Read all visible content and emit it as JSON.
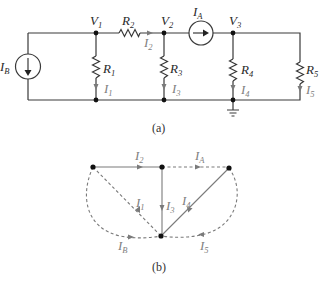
{
  "figure_a": {
    "caption": "(a)",
    "nodes": [
      {
        "id": "V1",
        "label": "V",
        "sub": "1"
      },
      {
        "id": "V2",
        "label": "V",
        "sub": "2"
      },
      {
        "id": "V3",
        "label": "V",
        "sub": "3"
      }
    ],
    "sources": [
      {
        "id": "IB",
        "label": "I",
        "sub": "B",
        "direction": "down"
      },
      {
        "id": "IA",
        "label": "I",
        "sub": "A",
        "direction": "right"
      }
    ],
    "resistors": [
      {
        "id": "R1",
        "label": "R",
        "sub": "1"
      },
      {
        "id": "R2",
        "label": "R",
        "sub": "2"
      },
      {
        "id": "R3",
        "label": "R",
        "sub": "3"
      },
      {
        "id": "R4",
        "label": "R",
        "sub": "4"
      },
      {
        "id": "R5",
        "label": "R",
        "sub": "5"
      }
    ],
    "currents": [
      {
        "id": "I1",
        "label": "I",
        "sub": "1"
      },
      {
        "id": "I2",
        "label": "I",
        "sub": "2"
      },
      {
        "id": "I3",
        "label": "I",
        "sub": "3"
      },
      {
        "id": "I4",
        "label": "I",
        "sub": "4"
      },
      {
        "id": "I5",
        "label": "I",
        "sub": "5"
      }
    ],
    "ground": "ground-symbol"
  },
  "figure_b": {
    "caption": "(b)",
    "edges": [
      {
        "id": "I2",
        "label": "I",
        "sub": "2",
        "style": "solid"
      },
      {
        "id": "IA",
        "label": "I",
        "sub": "A",
        "style": "dashed"
      },
      {
        "id": "I1",
        "label": "I",
        "sub": "1",
        "style": "dashed"
      },
      {
        "id": "I3",
        "label": "I",
        "sub": "3",
        "style": "solid"
      },
      {
        "id": "I4",
        "label": "I",
        "sub": "4",
        "style": "solid"
      },
      {
        "id": "IB",
        "label": "I",
        "sub": "B",
        "style": "dashed"
      },
      {
        "id": "I5",
        "label": "I",
        "sub": "5",
        "style": "dashed"
      }
    ]
  }
}
